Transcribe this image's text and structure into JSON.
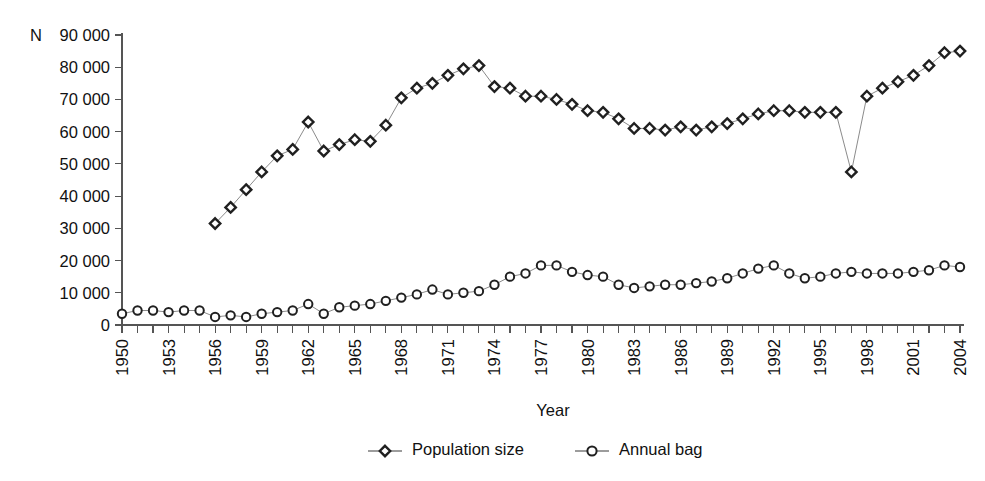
{
  "figure": {
    "background_color": "#ffffff",
    "axis_color": "#555555",
    "line_color": "#8b8b8b",
    "marker_stroke_color": "#202020",
    "text_color": "#111111"
  },
  "axes": {
    "y_axis_name": "N",
    "x_axis_title": "Year",
    "y_tick_labels": [
      "0",
      "10 000",
      "20 000",
      "30 000",
      "40 000",
      "50 000",
      "60 000",
      "70 000",
      "80 000",
      "90 000"
    ],
    "x_tick_labels": [
      "1950",
      "1953",
      "1956",
      "1959",
      "1962",
      "1965",
      "1968",
      "1971",
      "1974",
      "1977",
      "1980",
      "1983",
      "1986",
      "1989",
      "1992",
      "1995",
      "1998",
      "2001",
      "2004"
    ]
  },
  "legend": {
    "position": "bottom-center",
    "entries": [
      {
        "label": "Population size",
        "marker": "diamond"
      },
      {
        "label": "Annual bag",
        "marker": "circle"
      }
    ]
  },
  "chart_data": {
    "type": "line",
    "title": "",
    "subtitle": "",
    "xlabel": "Year",
    "ylabel": "N",
    "xlim": [
      1950,
      2004
    ],
    "ylim": [
      0,
      90000
    ],
    "ytick_step": 10000,
    "xtick_step": 1,
    "xtick_label_step": 3,
    "grid": false,
    "legend_position": "bottom-center",
    "x": [
      1950,
      1951,
      1952,
      1953,
      1954,
      1955,
      1956,
      1957,
      1958,
      1959,
      1960,
      1961,
      1962,
      1963,
      1964,
      1965,
      1966,
      1967,
      1968,
      1969,
      1970,
      1971,
      1972,
      1973,
      1974,
      1975,
      1976,
      1977,
      1978,
      1979,
      1980,
      1981,
      1982,
      1983,
      1984,
      1985,
      1986,
      1987,
      1988,
      1989,
      1990,
      1991,
      1992,
      1993,
      1994,
      1995,
      1996,
      1997,
      1998,
      1999,
      2000,
      2001,
      2002,
      2003,
      2004
    ],
    "series": [
      {
        "name": "Population size",
        "marker": "diamond",
        "values": [
          null,
          null,
          null,
          null,
          null,
          null,
          31500,
          36500,
          42000,
          47500,
          52500,
          54500,
          63000,
          54000,
          56000,
          57500,
          57000,
          62000,
          70500,
          73500,
          75000,
          77500,
          79500,
          80500,
          74000,
          73500,
          71000,
          71000,
          70000,
          68500,
          66500,
          66000,
          64000,
          61000,
          61000,
          60500,
          61500,
          60500,
          61500,
          62500,
          64000,
          65500,
          66500,
          66500,
          66000,
          66000,
          66000,
          47500,
          71000,
          73500,
          75500,
          77500,
          80500,
          84500,
          85000
        ]
      },
      {
        "name": "Annual bag",
        "marker": "circle",
        "values": [
          3500,
          4500,
          4500,
          4000,
          4500,
          4500,
          2500,
          3000,
          2500,
          3500,
          4000,
          4500,
          6500,
          3500,
          5500,
          6000,
          6500,
          7500,
          8500,
          9500,
          11000,
          9500,
          10000,
          10500,
          12500,
          15000,
          16000,
          18500,
          18500,
          16500,
          15500,
          15000,
          12500,
          11500,
          12000,
          12500,
          12500,
          13000,
          13500,
          14500,
          16000,
          17500,
          18500,
          16000,
          14500,
          15000,
          16000,
          16500,
          16000,
          16000,
          16000,
          16500,
          17000,
          18500,
          18000
        ]
      }
    ]
  }
}
